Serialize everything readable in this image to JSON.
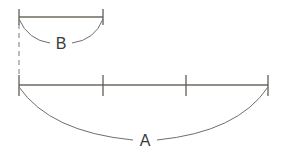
{
  "diagram": {
    "segment_b": {
      "label": "B",
      "x1": 19,
      "x2": 103,
      "y": 17,
      "arc_depth": 26
    },
    "segment_a": {
      "label": "A",
      "x1": 19,
      "x2": 268,
      "y": 85,
      "ticks_x": [
        103,
        186
      ],
      "arc_depth": 55
    },
    "guide": {
      "x": 19,
      "y1": 22,
      "y2": 78,
      "style": "dashed"
    },
    "colors": {
      "line": "#6f6a5e",
      "arc": "#6e6e6e",
      "text": "#3a3a3a"
    }
  }
}
